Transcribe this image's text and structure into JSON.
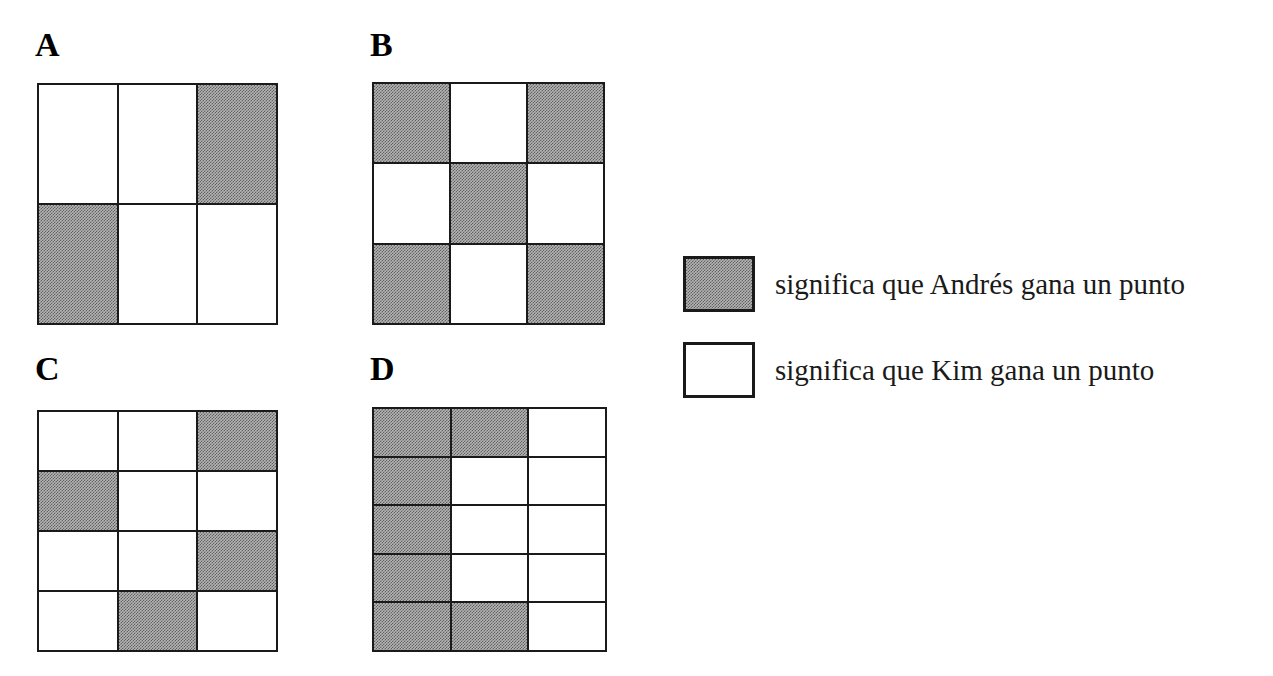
{
  "figure": {
    "kind": "probability-grid-diagram",
    "fill_grey_hex": "#b4b4b4",
    "line_hex": "#1a1a1a",
    "background_hex": "#ffffff"
  },
  "panels": [
    {
      "label": "A",
      "cols": 3,
      "rows": 2,
      "grey_count": 2,
      "white_count": 4,
      "cells": [
        [
          "white",
          "white",
          "grey"
        ],
        [
          "grey",
          "white",
          "white"
        ]
      ]
    },
    {
      "label": "B",
      "cols": 3,
      "rows": 3,
      "grey_count": 5,
      "white_count": 4,
      "cells": [
        [
          "grey",
          "white",
          "grey"
        ],
        [
          "white",
          "grey",
          "white"
        ],
        [
          "grey",
          "white",
          "grey"
        ]
      ]
    },
    {
      "label": "C",
      "cols": 3,
      "rows": 4,
      "grey_count": 4,
      "white_count": 8,
      "cells": [
        [
          "white",
          "white",
          "grey"
        ],
        [
          "grey",
          "white",
          "white"
        ],
        [
          "white",
          "white",
          "grey"
        ],
        [
          "white",
          "grey",
          "white"
        ]
      ]
    },
    {
      "label": "D",
      "cols": 3,
      "rows": 5,
      "grey_count": 7,
      "white_count": 8,
      "cells": [
        [
          "grey",
          "grey",
          "white"
        ],
        [
          "grey",
          "white",
          "white"
        ],
        [
          "grey",
          "white",
          "white"
        ],
        [
          "grey",
          "white",
          "white"
        ],
        [
          "grey",
          "grey",
          "white"
        ]
      ]
    }
  ],
  "legend": {
    "items": [
      {
        "swatch": "grey",
        "text": "significa que Andrés gana un punto"
      },
      {
        "swatch": "white",
        "text": "significa que Kim gana un punto"
      }
    ]
  }
}
